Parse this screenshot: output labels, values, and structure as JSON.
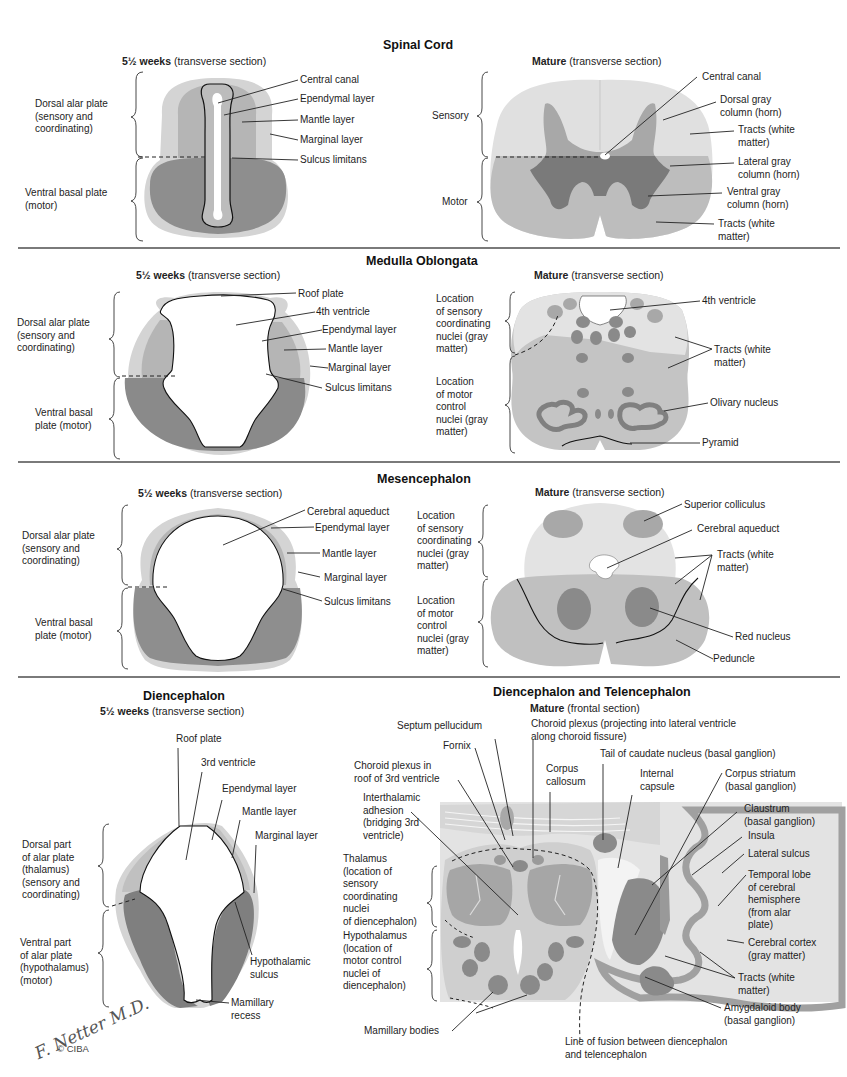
{
  "colors": {
    "marginal": "#d4d4d4",
    "mantle": "#b0b0b0",
    "basal": "#8e8e8e",
    "white_matter": "#e3e3e3",
    "gray_matter": "#9a9a9a",
    "nucleus_dark": "#858585",
    "outline": "#111111",
    "divider": "#7a7a7a"
  },
  "sections": {
    "spinal": {
      "title": "Spinal Cord",
      "embryo_sub": {
        "bold": "5½  weeks",
        "rest": " (transverse section)"
      },
      "mature_sub": {
        "bold": "Mature",
        "rest": "  (transverse section)"
      },
      "embryo_side": [
        "Dorsal alar plate\n(sensory and\ncoordinating)",
        "Ventral basal plate\n(motor)"
      ],
      "embryo_labels": [
        "Central canal",
        "Ependymal layer",
        "Mantle layer",
        "Marginal layer",
        "Sulcus limitans"
      ],
      "mature_side": [
        "Sensory",
        "Motor"
      ],
      "mature_labels": [
        "Central canal",
        "Dorsal gray\ncolumn (horn)",
        "Tracts (white\nmatter)",
        "Lateral gray\ncolumn (horn)",
        "Ventral gray\ncolumn (horn)",
        "Tracts (white\nmatter)"
      ]
    },
    "medulla": {
      "title": "Medulla Oblongata",
      "embryo_sub": {
        "bold": "5½  weeks",
        "rest": " (transverse section)"
      },
      "mature_sub": {
        "bold": "Mature",
        "rest": "  (transverse section)"
      },
      "embryo_side": [
        "Dorsal alar plate\n(sensory and\ncoordinating)",
        "Ventral basal\nplate (motor)"
      ],
      "embryo_labels": [
        "Roof plate",
        "4th ventricle",
        "Ependymal layer",
        "Mantle layer",
        "Marginal layer",
        "Sulcus limitans"
      ],
      "mature_side": [
        "Location\nof sensory\ncoordinating\nnuclei (gray\nmatter)",
        "Location\nof motor\ncontrol\nnuclei (gray\nmatter)"
      ],
      "mature_labels": [
        "4th ventricle",
        "Tracts (white\nmatter)",
        "Olivary nucleus",
        "Pyramid"
      ]
    },
    "mesencephalon": {
      "title": "Mesencephalon",
      "embryo_sub": {
        "bold": "5½  weeks",
        "rest": " (transverse section)"
      },
      "mature_sub": {
        "bold": "Mature",
        "rest": " (transverse section)"
      },
      "embryo_side": [
        "Dorsal alar plate\n(sensory and\ncoordinating)",
        "Ventral basal\nplate (motor)"
      ],
      "embryo_labels": [
        "Cerebral aqueduct",
        "Ependymal layer",
        "Mantle layer",
        "Marginal layer",
        "Sulcus limitans"
      ],
      "mature_side": [
        "Location\nof sensory\ncoordinating\nnuclei (gray\nmatter)",
        "Location\nof motor\ncontrol\nnuclei (gray\nmatter)"
      ],
      "mature_labels": [
        "Superior colliculus",
        "Cerebral aqueduct",
        "Tracts (white\nmatter)",
        "Red nucleus",
        "Peduncle"
      ]
    },
    "diencephalon": {
      "title": "Diencephalon",
      "embryo_sub": {
        "bold": "5½  weeks",
        "rest": " (transverse section)"
      },
      "embryo_side": [
        "Dorsal part\nof alar plate\n(thalamus)\n(sensory and\ncoordinating)",
        "Ventral part\nof alar plate\n(hypothalamus)\n(motor)"
      ],
      "embryo_labels": [
        "Roof plate",
        "3rd ventricle",
        "Ependymal layer",
        "Mantle layer",
        "Marginal layer",
        "Hypothalamic\nsulcus",
        "Mamillary\nrecess"
      ]
    },
    "telencephalon": {
      "title": "Diencephalon and Telencephalon",
      "mature_sub": {
        "bold": "Mature",
        "rest": "  (frontal section)"
      },
      "left_labels": [
        "Septum pellucidum",
        "Fornix",
        "Choroid plexus in\nroof of 3rd ventricle",
        "Interthalamic\nadhesion\n(bridging 3rd\nventricle)",
        "Thalamus\n(location of\nsensory\ncoordinating\nnuclei\nof diencephalon)",
        "Hypothalamus\n(location of\nmotor control\nnuclei of\ndiencephalon)",
        "Mamillary bodies"
      ],
      "top_labels": [
        "Choroid plexus (projecting into lateral ventricle\nalong choroid fissure)",
        "Corpus\ncallosum",
        "Tail of caudate nucleus (basal ganglion)",
        "Internal\ncapsule"
      ],
      "right_labels": [
        "Corpus striatum\n(basal ganglion)",
        "Claustrum\n(basal ganglion)",
        "Insula",
        "Lateral sulcus",
        "Temporal lobe\nof cerebral\nhemisphere\n(from alar\nplate)",
        "Cerebral cortex\n(gray matter)",
        "Tracts (white\nmatter)",
        "Amygdaloid body\n(basal ganglion)"
      ],
      "bottom_label": "Line of fusion between diencephalon\nand telencephalon"
    }
  },
  "signature": {
    "name": "F. Netter M.D.",
    "copyright": "© CIBA"
  }
}
